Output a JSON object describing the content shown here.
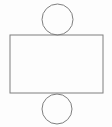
{
  "diagram": {
    "background_color": "#fdfdfd",
    "stroke_color": "#7f7f7f",
    "stroke_width": 1,
    "canvas": {
      "width": 112,
      "height": 127
    },
    "shapes": [
      {
        "type": "rect",
        "name": "rectangle-face",
        "x": 10,
        "y": 35,
        "width": 93,
        "height": 58
      },
      {
        "type": "circle",
        "name": "top-circle",
        "cx": 57.5,
        "cy": 19.5,
        "r": 15.5
      },
      {
        "type": "circle",
        "name": "bottom-circle",
        "cx": 57,
        "cy": 109,
        "r": 15
      }
    ]
  }
}
